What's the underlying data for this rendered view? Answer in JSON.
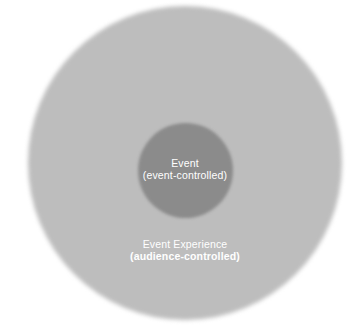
{
  "diagram": {
    "type": "concentric-circles",
    "background_color": "#ffffff",
    "width": 361,
    "height": 328,
    "outer_circle": {
      "name": "Event Experience",
      "label_primary": "Event Experience",
      "label_secondary": "(audience-controlled)",
      "fill_color": "#bdbdbd",
      "text_color": "#ffffff",
      "center_x": 185,
      "center_y": 163,
      "diameter": 314
    },
    "inner_circle": {
      "name": "Event",
      "label_primary": "Event",
      "label_secondary": "(event-controlled)",
      "fill_color": "#8b8b8b",
      "text_color": "#ffffff",
      "center_x": 185,
      "center_y": 170,
      "diameter": 95
    }
  }
}
